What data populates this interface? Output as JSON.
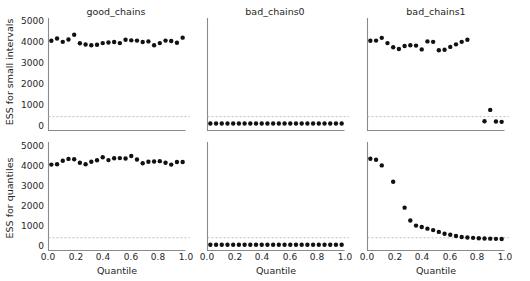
{
  "figure": {
    "background": "#ffffff",
    "point_color": "#111111",
    "spine_color": "#8a8a8a",
    "refline_color": "#b9b9b9",
    "xlabel": "Quantile",
    "ylabel_top": "ESS for small intervals",
    "ylabel_bottom": "ESS for quantiles",
    "column_titles": [
      "good_chains",
      "bad_chains0",
      "bad_chains1"
    ],
    "y_ticks": [
      "0",
      "1000",
      "2000",
      "3000",
      "4000",
      "5000"
    ],
    "x_ticks": [
      "0.0",
      "0.2",
      "0.4",
      "0.6",
      "0.8",
      "1.0"
    ]
  },
  "chart_data": {
    "type": "scatter",
    "title": "",
    "xlabel": "Quantile",
    "ylabel": "ESS",
    "xlim": [
      0.0,
      1.0
    ],
    "ylim": [
      0,
      5000
    ],
    "grid": false,
    "legend": "none",
    "reference_line": {
      "y": 400,
      "style": "dashed",
      "color": "#b9b9b9"
    },
    "layout": {
      "rows": 2,
      "cols": 3,
      "row_labels": [
        "ESS for small intervals",
        "ESS for quantiles"
      ],
      "col_labels": [
        "good_chains",
        "bad_chains0",
        "bad_chains1"
      ]
    },
    "x": [
      0.05,
      0.09,
      0.14,
      0.19,
      0.24,
      0.28,
      0.33,
      0.38,
      0.43,
      0.47,
      0.52,
      0.57,
      0.62,
      0.66,
      0.71,
      0.76,
      0.81,
      0.85,
      0.9,
      0.95
    ],
    "panels": [
      {
        "row": 0,
        "col": 0,
        "title": "good_chains",
        "ylabel": "ESS for small intervals",
        "values": [
          4010,
          4120,
          3960,
          4070,
          4300,
          3890,
          3830,
          3800,
          3820,
          3900,
          3930,
          3950,
          3900,
          4060,
          4030,
          4020,
          3950,
          3980,
          3800,
          3900,
          4020,
          4000,
          3920,
          4160
        ]
      },
      {
        "row": 0,
        "col": 1,
        "title": "bad_chains0",
        "ylabel": "ESS for small intervals",
        "values": [
          70,
          70,
          70,
          70,
          70,
          70,
          70,
          70,
          70,
          70,
          70,
          70,
          70,
          70,
          70,
          70,
          70,
          70,
          70,
          70,
          70,
          70,
          70,
          70
        ]
      },
      {
        "row": 0,
        "col": 2,
        "title": "bad_chains1",
        "ylabel": "ESS for small intervals",
        "values": [
          4010,
          4020,
          4150,
          3900,
          3700,
          3620,
          3760,
          3800,
          3780,
          3600,
          3980,
          3960,
          3560,
          3580,
          3720,
          3840,
          3960,
          4060,
          null,
          null,
          180,
          720,
          170,
          150
        ]
      },
      {
        "row": 1,
        "col": 0,
        "title": "good_chains",
        "ylabel": "ESS for quantiles",
        "values": [
          3990,
          4010,
          4180,
          4270,
          4250,
          4080,
          4010,
          4130,
          4200,
          4350,
          4210,
          4300,
          4310,
          4290,
          4410,
          4240,
          4060,
          4130,
          4140,
          4160,
          4080,
          3990,
          4120,
          4120
        ]
      },
      {
        "row": 1,
        "col": 1,
        "title": "bad_chains0",
        "ylabel": "ESS for quantiles",
        "values": [
          60,
          60,
          60,
          60,
          60,
          60,
          60,
          60,
          60,
          60,
          60,
          60,
          60,
          60,
          60,
          60,
          60,
          60,
          60,
          60,
          60,
          60,
          60,
          60
        ]
      },
      {
        "row": 1,
        "col": 2,
        "title": "bad_chains1",
        "ylabel": "ESS for quantiles",
        "values": [
          4280,
          4230,
          3950,
          null,
          3150,
          null,
          1880,
          1250,
          1000,
          930,
          850,
          780,
          690,
          600,
          550,
          490,
          440,
          420,
          400,
          380,
          370,
          360,
          350,
          340
        ]
      }
    ]
  }
}
